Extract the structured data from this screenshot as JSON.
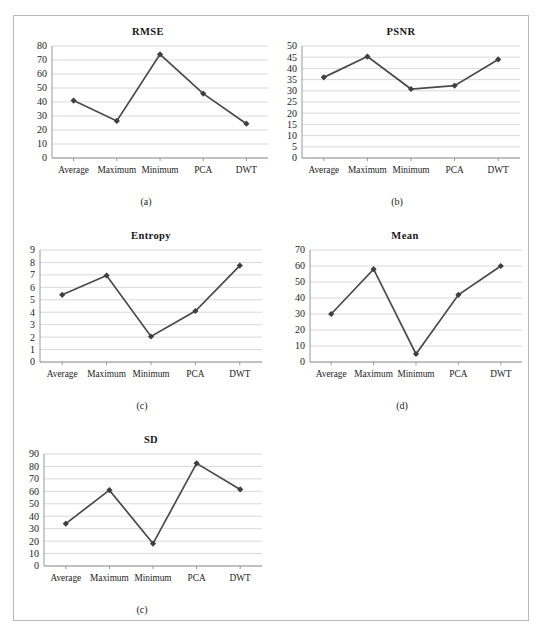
{
  "figure": {
    "categories": [
      "Average",
      "Maximum",
      "Minimum",
      "PCA",
      "DWT"
    ],
    "panels": [
      {
        "id": "rmse",
        "caption": "(a)",
        "chart_data": {
          "type": "line",
          "title": "RMSE",
          "xlabel": "",
          "ylabel": "",
          "categories": [
            "Average",
            "Maximum",
            "Minimum",
            "PCA",
            "DWT"
          ],
          "values": [
            41,
            26.5,
            74,
            46,
            24.5
          ],
          "ylim": [
            0,
            80
          ],
          "yticks": [
            0,
            10,
            20,
            30,
            40,
            50,
            60,
            70,
            80
          ],
          "grid": true,
          "legend": "none",
          "marker": "diamond",
          "series_color": "#4a4a4a"
        }
      },
      {
        "id": "psnr",
        "caption": "(b)",
        "chart_data": {
          "type": "line",
          "title": "PSNR",
          "xlabel": "",
          "ylabel": "",
          "categories": [
            "Average",
            "Maximum",
            "Minimum",
            "PCA",
            "DWT"
          ],
          "values": [
            36,
            45.3,
            30.8,
            32.3,
            44
          ],
          "ylim": [
            0,
            50
          ],
          "yticks": [
            0,
            5,
            10,
            15,
            20,
            25,
            30,
            35,
            40,
            45,
            50
          ],
          "grid": true,
          "legend": "none",
          "marker": "diamond",
          "series_color": "#4a4a4a"
        }
      },
      {
        "id": "entropy",
        "caption": "(c)",
        "chart_data": {
          "type": "line",
          "title": "Entropy",
          "xlabel": "",
          "ylabel": "",
          "categories": [
            "Average",
            "Maximum",
            "Minimum",
            "PCA",
            "DWT"
          ],
          "values": [
            5.4,
            6.95,
            2.05,
            4.1,
            7.75
          ],
          "ylim": [
            0,
            9
          ],
          "yticks": [
            0,
            1,
            2,
            3,
            4,
            5,
            6,
            7,
            8,
            9
          ],
          "grid": true,
          "legend": "none",
          "marker": "diamond",
          "series_color": "#4a4a4a"
        }
      },
      {
        "id": "mean",
        "caption": "(d)",
        "chart_data": {
          "type": "line",
          "title": "Mean",
          "xlabel": "",
          "ylabel": "",
          "categories": [
            "Average",
            "Maximum",
            "Minimum",
            "PCA",
            "DWT"
          ],
          "values": [
            30,
            58,
            5,
            42,
            60
          ],
          "ylim": [
            0,
            70
          ],
          "yticks": [
            0,
            10,
            20,
            30,
            40,
            50,
            60,
            70
          ],
          "grid": true,
          "legend": "none",
          "marker": "diamond",
          "series_color": "#4a4a4a"
        }
      },
      {
        "id": "sd",
        "caption": "(c)",
        "chart_data": {
          "type": "line",
          "title": "SD",
          "xlabel": "",
          "ylabel": "",
          "categories": [
            "Average",
            "Maximum",
            "Minimum",
            "PCA",
            "DWT"
          ],
          "values": [
            34,
            61,
            18,
            82.5,
            61.5
          ],
          "ylim": [
            0,
            90
          ],
          "yticks": [
            0,
            10,
            20,
            30,
            40,
            50,
            60,
            70,
            80,
            90
          ],
          "grid": true,
          "legend": "none",
          "marker": "diamond",
          "series_color": "#4a4a4a"
        }
      }
    ]
  },
  "chart_data": [
    {
      "type": "line",
      "title": "RMSE",
      "categories": [
        "Average",
        "Maximum",
        "Minimum",
        "PCA",
        "DWT"
      ],
      "values": [
        41,
        26.5,
        74,
        46,
        24.5
      ],
      "ylim": [
        0,
        80
      ],
      "xlabel": "",
      "ylabel": ""
    },
    {
      "type": "line",
      "title": "PSNR",
      "categories": [
        "Average",
        "Maximum",
        "Minimum",
        "PCA",
        "DWT"
      ],
      "values": [
        36,
        45.3,
        30.8,
        32.3,
        44
      ],
      "ylim": [
        0,
        50
      ],
      "xlabel": "",
      "ylabel": ""
    },
    {
      "type": "line",
      "title": "Entropy",
      "categories": [
        "Average",
        "Maximum",
        "Minimum",
        "PCA",
        "DWT"
      ],
      "values": [
        5.4,
        6.95,
        2.05,
        4.1,
        7.75
      ],
      "ylim": [
        0,
        9
      ],
      "xlabel": "",
      "ylabel": ""
    },
    {
      "type": "line",
      "title": "Mean",
      "categories": [
        "Average",
        "Maximum",
        "Minimum",
        "PCA",
        "DWT"
      ],
      "values": [
        30,
        58,
        5,
        42,
        60
      ],
      "ylim": [
        0,
        70
      ],
      "xlabel": "",
      "ylabel": ""
    },
    {
      "type": "line",
      "title": "SD",
      "categories": [
        "Average",
        "Maximum",
        "Minimum",
        "PCA",
        "DWT"
      ],
      "values": [
        34,
        61,
        18,
        82.5,
        61.5
      ],
      "ylim": [
        0,
        90
      ],
      "xlabel": "",
      "ylabel": ""
    }
  ]
}
